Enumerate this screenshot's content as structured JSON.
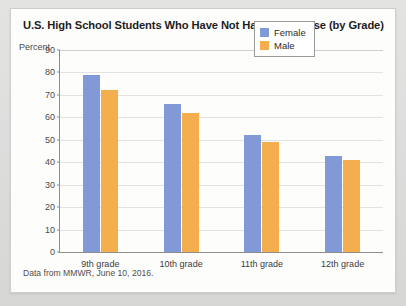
{
  "card": {
    "source_note": "Data from MMWR, June 10, 2016."
  },
  "legend": {
    "position": "top-right",
    "items": [
      {
        "label": "Female",
        "color": "#8199d6",
        "icon": "legend-swatch-icon"
      },
      {
        "label": "Male",
        "color": "#f5ae4e",
        "icon": "legend-swatch-icon"
      }
    ]
  },
  "chart_data": {
    "type": "bar",
    "title": "U.S. High School Students Who Have Not Had Intercourse (by Grade)",
    "xlabel": "",
    "ylabel": "Percent",
    "categories": [
      "9th grade",
      "10th grade",
      "11th grade",
      "12th grade"
    ],
    "series": [
      {
        "name": "Female",
        "color": "#8199d6",
        "values": [
          79,
          66,
          52,
          43
        ]
      },
      {
        "name": "Male",
        "color": "#f5ae4e",
        "values": [
          72,
          62,
          49,
          41
        ]
      }
    ],
    "ylim": [
      0,
      90
    ],
    "ytick_step": 10,
    "yticks": [
      0,
      10,
      20,
      30,
      40,
      50,
      60,
      70,
      80,
      90
    ],
    "grid": true,
    "legend_position": "top-right"
  }
}
